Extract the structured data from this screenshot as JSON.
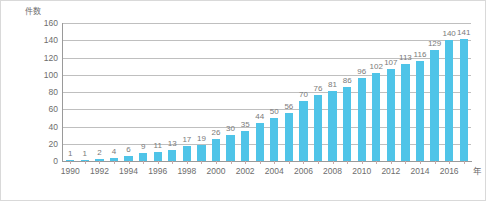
{
  "chart_data": {
    "type": "bar",
    "title": "",
    "ylabel": "件数",
    "xlabel": "年",
    "ylim": [
      0,
      160
    ],
    "ytick_step": 20,
    "yticks": [
      0,
      20,
      40,
      60,
      80,
      100,
      120,
      140,
      160
    ],
    "grid": true,
    "legend": "none",
    "bar_color": "#4fc4e8",
    "label_color": "#7a7a7a",
    "axis_color": "#6d6d6d",
    "categories": [
      "1990",
      "1991",
      "1992",
      "1993",
      "1994",
      "1995",
      "1996",
      "1997",
      "1998",
      "1999",
      "2000",
      "2001",
      "2002",
      "2003",
      "2004",
      "2005",
      "2006",
      "2007",
      "2008",
      "2009",
      "2010",
      "2011",
      "2012",
      "2013",
      "2014",
      "2015",
      "2016",
      "2017"
    ],
    "xtick_labels": [
      "1990",
      "1992",
      "1994",
      "1996",
      "1998",
      "2000",
      "2002",
      "2004",
      "2006",
      "2008",
      "2010",
      "2012",
      "2014",
      "2016"
    ],
    "values": [
      1,
      1,
      2,
      4,
      6,
      9,
      11,
      13,
      17,
      19,
      26,
      30,
      35,
      44,
      50,
      56,
      70,
      76,
      81,
      86,
      96,
      102,
      107,
      113,
      116,
      129,
      140,
      141
    ]
  }
}
